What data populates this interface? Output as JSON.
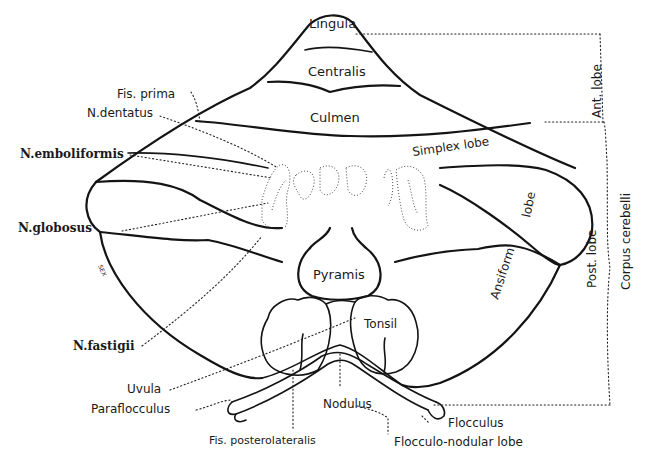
{
  "figure": {
    "background": "#ffffff",
    "ink": "#141414"
  },
  "regions": {
    "lingula": "Lingula",
    "centralis": "Centralis",
    "culmen": "Culmen",
    "simplex": "Simplex lobe",
    "ansiform": "Ansiform",
    "ansiform_lobe": "lobe",
    "pyramis": "Pyramis",
    "tonsil": "Tonsil",
    "nodulus": "Nodulus"
  },
  "left_labels": {
    "fis_prima": "Fis. prima",
    "n_dentatus": "N.dentatus",
    "n_emboliformis": "N.emboliformis",
    "n_globosus": "N.globosus",
    "n_fastigii": "N.fastigii",
    "uvula": "Uvula",
    "paraflocculus": "Paraflocculus",
    "sex": "SEX"
  },
  "bottom_labels": {
    "fis_posterolateralis": "Fis. posterolateralis",
    "flocculus": "Flocculus",
    "flocculo_nodular": "Flocculo-nodular lobe"
  },
  "right_brackets": {
    "ant_lobe": "Ant. lobe",
    "post_lobe": "Post. lobe",
    "corpus_cerebelli": "Corpus cerebelli"
  }
}
